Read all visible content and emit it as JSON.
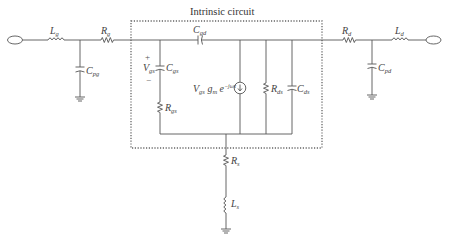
{
  "diagram": {
    "title": "Intrinsic circuit",
    "components": {
      "Lg": {
        "base": "L",
        "sub": "g",
        "type": "inductor"
      },
      "Rg": {
        "base": "R",
        "sub": "g",
        "type": "resistor"
      },
      "Cpg": {
        "base": "C",
        "sub": "pg",
        "type": "capacitor"
      },
      "Cgd": {
        "base": "C",
        "sub": "gd",
        "type": "capacitor"
      },
      "Cgs": {
        "base": "C",
        "sub": "gs",
        "type": "capacitor"
      },
      "Rgs": {
        "base": "R",
        "sub": "gs",
        "type": "resistor"
      },
      "Rds": {
        "base": "R",
        "sub": "ds",
        "type": "resistor"
      },
      "Cds": {
        "base": "C",
        "sub": "ds",
        "type": "capacitor"
      },
      "Rs": {
        "base": "R",
        "sub": "s",
        "type": "resistor"
      },
      "Ls": {
        "base": "L",
        "sub": "s",
        "type": "inductor"
      },
      "Rd": {
        "base": "R",
        "sub": "d",
        "type": "resistor"
      },
      "Cpd": {
        "base": "C",
        "sub": "pd",
        "type": "capacitor"
      },
      "Ld": {
        "base": "L",
        "sub": "d",
        "type": "inductor"
      }
    },
    "vgs": {
      "base": "V",
      "sub": "gs",
      "plus": "+",
      "minus": "−"
    },
    "current_source": {
      "v": "V",
      "v_sub": "gs",
      "g": "g",
      "g_sub": "m",
      "exp_base": "e",
      "exp_sup": "−jωτ",
      "type": "voltage-controlled current source"
    },
    "ports": [
      "gate-port",
      "drain-port"
    ],
    "grounds": [
      "Cpg-ground",
      "Rs-Ls-ground",
      "Cpd-ground"
    ]
  }
}
